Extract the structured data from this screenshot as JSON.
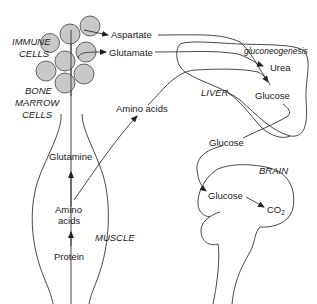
{
  "diagram": {
    "regions": {
      "immune_cells": "IMMUNE\nCELLS",
      "immune_line1": "IMMUNE",
      "immune_line2": "CELLS",
      "bone_line1": "BONE",
      "bone_line2": "MARROW",
      "bone_line3": "CELLS",
      "liver": "LIVER",
      "brain": "BRAIN",
      "muscle": "MUSCLE"
    },
    "metabolites": {
      "aspartate": "Aspartate",
      "glutamate": "Glutamate",
      "urea": "Urea",
      "liver_glucose": "Glucose",
      "blood_glucose": "Glucose",
      "brain_glucose": "Glucose",
      "co2_main": "CO",
      "co2_sub": "2",
      "amino_acids_blood": "Amino acids",
      "glutamine": "Glutamine",
      "muscle_amino_line1": "Amino",
      "muscle_amino_line2": "acids",
      "protein": "Protein"
    },
    "process": {
      "gluconeogenesis": "gluconeogenesis"
    },
    "colors": {
      "cell_fill": "#c8c8c8",
      "line": "#333333"
    }
  }
}
